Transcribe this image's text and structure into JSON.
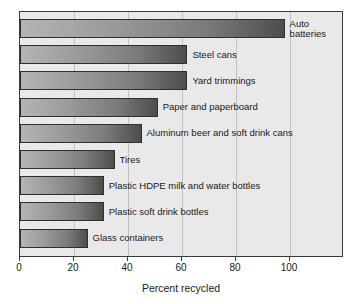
{
  "chart_data": {
    "type": "bar",
    "orientation": "horizontal",
    "title": "",
    "xlabel": "Percent recycled",
    "ylabel": "",
    "xlim": [
      0,
      120
    ],
    "xticks": [
      0,
      20,
      40,
      60,
      80,
      100
    ],
    "grid": true,
    "legend": null,
    "categories": [
      "Auto batteries",
      "Steel cans",
      "Yard trimmings",
      "Paper and paperboard",
      "Aluminum beer and soft drink cans",
      "Tires",
      "Plastic HDPE milk and water bottles",
      "Plastic soft drink bottles",
      "Glass containers"
    ],
    "values": [
      98,
      62,
      62,
      51,
      45,
      35,
      31,
      31,
      25
    ],
    "bars": [
      {
        "label": "Auto batteries",
        "value": 98,
        "wrap": true
      },
      {
        "label": "Steel cans",
        "value": 62,
        "wrap": false
      },
      {
        "label": "Yard trimmings",
        "value": 62,
        "wrap": false
      },
      {
        "label": "Paper and paperboard",
        "value": 51,
        "wrap": false
      },
      {
        "label": "Aluminum beer and soft drink cans",
        "value": 45,
        "wrap": false
      },
      {
        "label": "Tires",
        "value": 35,
        "wrap": false
      },
      {
        "label": "Plastic HDPE milk and water bottles",
        "value": 31,
        "wrap": false
      },
      {
        "label": "Plastic soft drink bottles",
        "value": 31,
        "wrap": false
      },
      {
        "label": "Glass containers",
        "value": 25,
        "wrap": false
      }
    ],
    "colors": {
      "plot_background": "#e9e9e9",
      "page_background": "#ffffff",
      "axis": "#3a3a3a",
      "gridline": "#c2c2c2",
      "bar_gradient_light": "#b4b4b4",
      "bar_gradient_dark": "#4d4d4d",
      "bar_border": "#2f2f2f",
      "text": "#1a1a1a"
    }
  },
  "axis": {
    "x_title": "Percent recycled",
    "tick_labels": [
      "0",
      "20",
      "40",
      "60",
      "80",
      "100"
    ]
  }
}
